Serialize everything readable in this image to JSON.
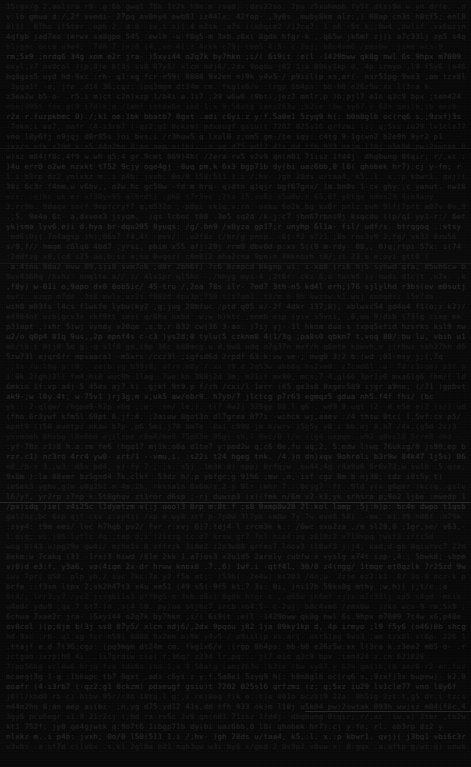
{
  "page": {
    "kind": "dark-document-page",
    "width": 471,
    "height": 767,
    "background_color": "#060606",
    "text_color": "#1b1b1b",
    "rule_color": "#2a2a2a",
    "legibility_note": "Text is rendered near-black on black and is not legible at any magnification.",
    "line_height_px": 10,
    "font_size_px": 7.4,
    "left_margin_px": 6,
    "right_margin_px": 5,
    "line_count": 75
  },
  "rules": [
    {
      "name": "rule-upper",
      "top": 148,
      "left": 0,
      "width": 471,
      "faint": true
    },
    {
      "name": "rule-mid-upper",
      "top": 263,
      "left": 0,
      "width": 471,
      "faint": true
    },
    {
      "name": "rule-center",
      "top": 502,
      "left": 0,
      "width": 471,
      "faint": false
    },
    {
      "name": "rule-lower-right",
      "top": 711,
      "left": 305,
      "width": 166,
      "faint": false
    }
  ],
  "blocks": [
    {
      "name": "block-one",
      "start_line": 0,
      "lines": [
        {
          "tone": "dim",
          "fill": 0.97
        },
        {
          "tone": "normal",
          "fill": 0.99
        },
        {
          "tone": "dim",
          "fill": 0.94
        },
        {
          "tone": "normal",
          "fill": 1.0
        },
        {
          "tone": "dimmer",
          "fill": 0.91
        },
        {
          "tone": "lift",
          "fill": 0.98
        },
        {
          "tone": "dim",
          "fill": 0.96
        },
        {
          "tone": "normal",
          "fill": 0.99
        },
        {
          "tone": "dim",
          "fill": 0.88
        },
        {
          "tone": "normal",
          "fill": 0.97
        },
        {
          "tone": "dimmer",
          "fill": 0.93
        },
        {
          "tone": "lift",
          "fill": 1.0
        },
        {
          "tone": "dim",
          "fill": 0.95
        },
        {
          "tone": "normal",
          "fill": 0.9
        },
        {
          "tone": "dim",
          "fill": 0.99
        }
      ]
    },
    {
      "name": "block-two",
      "start_line": 15,
      "lines": [
        {
          "tone": "normal",
          "fill": 0.98
        },
        {
          "tone": "lift",
          "fill": 0.93
        },
        {
          "tone": "dim",
          "fill": 1.0
        },
        {
          "tone": "normal",
          "fill": 0.96
        },
        {
          "tone": "dimmer",
          "fill": 0.89
        },
        {
          "tone": "dim",
          "fill": 0.98
        },
        {
          "tone": "normal",
          "fill": 0.94
        },
        {
          "tone": "lift",
          "fill": 0.99
        },
        {
          "tone": "dim",
          "fill": 0.92
        },
        {
          "tone": "normal",
          "fill": 1.0
        },
        {
          "tone": "dim",
          "fill": 0.87
        }
      ]
    },
    {
      "name": "block-three",
      "start_line": 26,
      "lines": [
        {
          "tone": "normal",
          "fill": 0.99
        },
        {
          "tone": "dim",
          "fill": 0.95
        },
        {
          "tone": "lift",
          "fill": 1.0
        },
        {
          "tone": "dimmer",
          "fill": 0.9
        },
        {
          "tone": "normal",
          "fill": 0.97
        },
        {
          "tone": "dim",
          "fill": 0.93
        },
        {
          "tone": "normal",
          "fill": 0.99
        },
        {
          "tone": "lift",
          "fill": 0.96
        },
        {
          "tone": "dim",
          "fill": 1.0
        },
        {
          "tone": "normal",
          "fill": 0.91
        },
        {
          "tone": "dimmer",
          "fill": 0.98
        },
        {
          "tone": "dim",
          "fill": 0.94
        },
        {
          "tone": "normal",
          "fill": 1.0
        },
        {
          "tone": "lift",
          "fill": 0.88
        },
        {
          "tone": "dim",
          "fill": 0.97
        },
        {
          "tone": "normal",
          "fill": 0.99
        },
        {
          "tone": "dim",
          "fill": 0.92
        },
        {
          "tone": "dimmer",
          "fill": 0.96
        },
        {
          "tone": "normal",
          "fill": 1.0
        },
        {
          "tone": "lift",
          "fill": 0.94
        },
        {
          "tone": "dim",
          "fill": 0.98
        },
        {
          "tone": "normal",
          "fill": 0.9
        },
        {
          "tone": "dim",
          "fill": 0.99
        },
        {
          "tone": "normal",
          "fill": 0.95
        }
      ]
    },
    {
      "name": "block-four",
      "start_line": 50,
      "lines": [
        {
          "tone": "lift",
          "fill": 0.99
        },
        {
          "tone": "dim",
          "fill": 0.93
        },
        {
          "tone": "normal",
          "fill": 1.0
        },
        {
          "tone": "dimmer",
          "fill": 0.89
        },
        {
          "tone": "dim",
          "fill": 0.97
        },
        {
          "tone": "normal",
          "fill": 0.94
        },
        {
          "tone": "lift",
          "fill": 0.99
        },
        {
          "tone": "dim",
          "fill": 1.0
        },
        {
          "tone": "normal",
          "fill": 0.91
        },
        {
          "tone": "dimmer",
          "fill": 0.96
        },
        {
          "tone": "dim",
          "fill": 0.98
        },
        {
          "tone": "normal",
          "fill": 0.93
        },
        {
          "tone": "lift",
          "fill": 1.0
        },
        {
          "tone": "dim",
          "fill": 0.95
        },
        {
          "tone": "normal",
          "fill": 0.99
        },
        {
          "tone": "dim",
          "fill": 0.87
        },
        {
          "tone": "dimmer",
          "fill": 0.97
        },
        {
          "tone": "normal",
          "fill": 1.0
        },
        {
          "tone": "lift",
          "fill": 0.92
        },
        {
          "tone": "dim",
          "fill": 0.98
        },
        {
          "tone": "normal",
          "fill": 0.96
        },
        {
          "tone": "dim",
          "fill": 0.99
        },
        {
          "tone": "normal",
          "fill": 0.9
        },
        {
          "tone": "lift",
          "fill": 1.0
        },
        {
          "tone": "dim",
          "fill": 0.94
        }
      ]
    }
  ],
  "glyph_pool": "etaoinshrdlucmfwypvbgkjqxz.,;:-()/0123456789"
}
